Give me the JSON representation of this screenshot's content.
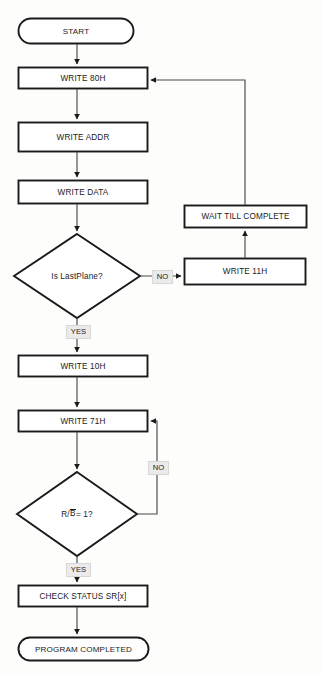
{
  "diagram": {
    "background_color": "#fdfdfc",
    "line_color": "#3a3a3a",
    "shape_stroke_color": "#1a1a1a",
    "label_box_color": "#eceaea"
  },
  "nodes": {
    "start": {
      "label": "START",
      "shape": "terminal"
    },
    "write_80h": {
      "label": "WRITE 80H",
      "shape": "process"
    },
    "write_addr": {
      "label": "WRITE ADDR",
      "shape": "process"
    },
    "write_data": {
      "label": "WRITE DATA",
      "shape": "process"
    },
    "is_lastplane": {
      "label": "Is LastPlane?",
      "shape": "decision"
    },
    "write_11h": {
      "label": "WRITE 11H",
      "shape": "process"
    },
    "wait_till_complete": {
      "label": "WAIT TILL COMPLETE",
      "shape": "process"
    },
    "write_10h": {
      "label": "WRITE 10H",
      "shape": "process"
    },
    "write_71h": {
      "label": "WRITE 71H",
      "shape": "process"
    },
    "rb_check": {
      "label_prefix": "R/",
      "label_overline": "B",
      "label_suffix": " = 1?",
      "shape": "decision"
    },
    "check_status": {
      "label": "CHECK STATUS SR[x]",
      "shape": "process"
    },
    "program_completed": {
      "label": "PROGRAM COMPLETED",
      "shape": "terminal"
    }
  },
  "edge_labels": {
    "lastplane_no": "NO",
    "lastplane_yes": "YES",
    "rb_no": "NO",
    "rb_yes": "YES"
  }
}
